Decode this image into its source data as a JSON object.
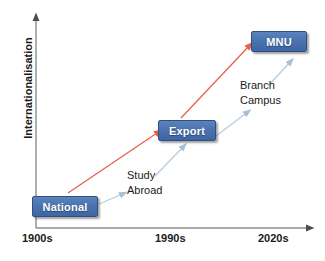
{
  "diagram": {
    "title_axis_y": "Internationalisation",
    "axis": {
      "y_label": "Internationalisation",
      "x_ticks": [
        "1900s",
        "1990s",
        "2020s"
      ],
      "axis_color": "#7f7f7f"
    },
    "stages": [
      {
        "id": "national",
        "label": "National",
        "x_period": "1900s"
      },
      {
        "id": "export",
        "label": "Export",
        "x_period": "1990s"
      },
      {
        "id": "mnu",
        "label": "MNU",
        "x_period": "2020s"
      }
    ],
    "annotations": [
      {
        "id": "study-abroad",
        "label": "Study\nAbroad"
      },
      {
        "id": "branch-campus",
        "label": "Branch\nCampus"
      }
    ],
    "colors": {
      "box_fill": "#4a73b0",
      "box_border": "#2f4f82",
      "box_text": "#ffffff",
      "progression_arrow": "#e8604c",
      "annotation_arrow": "#b9cbe0",
      "axis": "#7f7f7f",
      "text": "#1a1a1a",
      "background": "#ffffff"
    }
  }
}
